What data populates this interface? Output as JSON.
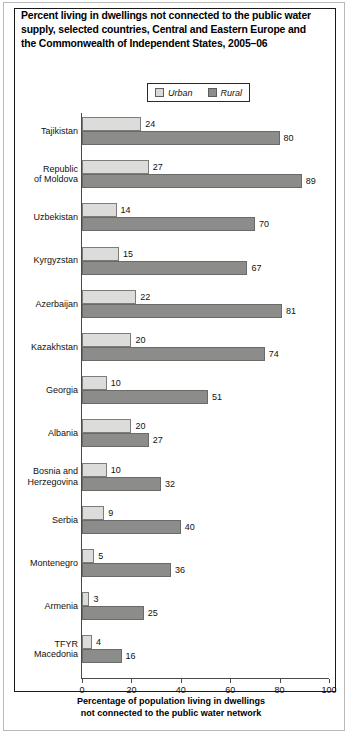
{
  "title": "Percent living in dwellings not connected to the public water supply, selected countries, Central and Eastern Europe and the Commonwealth of Independent States, 2005–06",
  "legend": {
    "urban_label": "Urban",
    "rural_label": "Rural",
    "urban_color": "#dcdcda",
    "rural_color": "#8c8c8a"
  },
  "axis_caption_line1": "Percentage of population living in dwellings",
  "axis_caption_line2": "not connected to the public water network",
  "chart_data": {
    "type": "bar",
    "orientation": "horizontal",
    "title": "Percent living in dwellings not connected to the public water supply, selected countries, Central and Eastern Europe and the Commonwealth of Independent States, 2005–06",
    "xlabel": "Percentage of population living in dwellings not connected to the public water network",
    "ylabel": "",
    "xlim": [
      0,
      100
    ],
    "xticks": [
      0,
      20,
      40,
      60,
      80,
      100
    ],
    "xtick_labels": [
      "0",
      "20",
      "40",
      "60",
      "80",
      "100"
    ],
    "grid": false,
    "legend_position": "top-center",
    "categories": [
      "Tajikistan",
      "Republic of Moldova",
      "Uzbekistan",
      "Kyrgyzstan",
      "Azerbaijan",
      "Kazakhstan",
      "Georgia",
      "Albania",
      "Bosnia and Herzegovina",
      "Serbia",
      "Montenegro",
      "Armenia",
      "TFYR Macedonia"
    ],
    "category_lines": [
      [
        "Tajikistan"
      ],
      [
        "Republic",
        "of Moldova"
      ],
      [
        "Uzbekistan"
      ],
      [
        "Kyrgyzstan"
      ],
      [
        "Azerbaijan"
      ],
      [
        "Kazakhstan"
      ],
      [
        "Georgia"
      ],
      [
        "Albania"
      ],
      [
        "Bosnia and",
        "Herzegovina"
      ],
      [
        "Serbia"
      ],
      [
        "Montenegro"
      ],
      [
        "Armenia"
      ],
      [
        "TFYR",
        "Macedonia"
      ]
    ],
    "series": [
      {
        "name": "Urban",
        "color": "#dcdcda",
        "values": [
          24,
          27,
          14,
          15,
          22,
          20,
          10,
          20,
          10,
          9,
          5,
          3,
          4
        ]
      },
      {
        "name": "Rural",
        "color": "#8c8c8a",
        "values": [
          80,
          89,
          70,
          67,
          81,
          74,
          51,
          27,
          32,
          40,
          36,
          25,
          16
        ]
      }
    ]
  }
}
